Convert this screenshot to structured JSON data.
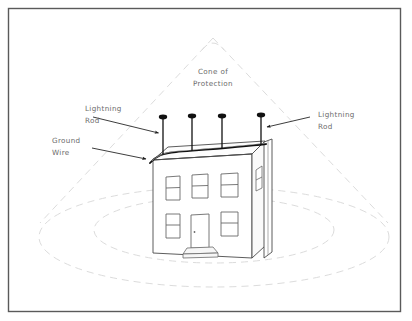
{
  "figure": {
    "background_color": "#ffffff",
    "border_color": "#555555",
    "label_color": "#6b6b6b",
    "line_color": "#3a3a3a",
    "faint_line_color": "#dcdcdc",
    "wire_color": "#1a1a1a"
  },
  "labels": {
    "cone": {
      "line1": "Cone of",
      "line2": "Protection"
    },
    "lightning_rod_left": {
      "line1": "Lightning",
      "line2": "Rod"
    },
    "lightning_rod_right": {
      "line1": "Lightning",
      "line2": "Rod"
    },
    "ground_wire": {
      "line1": "Ground",
      "line2": "Wire"
    }
  },
  "components": {
    "lightning_rods": [
      {
        "name": "rod-1",
        "x": 163,
        "tip_y": 116,
        "base_y": 156
      },
      {
        "name": "rod-2",
        "x": 192,
        "tip_y": 115,
        "base_y": 152
      },
      {
        "name": "rod-3",
        "x": 222,
        "tip_y": 115,
        "base_y": 149
      },
      {
        "name": "rod-4",
        "x": 261,
        "tip_y": 114,
        "base_y": 146
      }
    ],
    "ground_wire": {
      "name": "ground-wire",
      "runs_along": "roof ridge"
    },
    "down_conductor": {
      "name": "down-conductor",
      "x": 268,
      "top_y": 140,
      "bottom_y": 258
    },
    "building": {
      "name": "two-story-house",
      "front_windows_upper": 3,
      "front_windows_lower": 2,
      "side_windows": 2,
      "doors": 1,
      "stoop": 1
    },
    "protection_zone": {
      "apex": {
        "x": 213,
        "y": 38
      },
      "base_left": {
        "x": 40,
        "y": 222
      },
      "base_right": {
        "x": 388,
        "y": 222
      },
      "ellipses": 2
    }
  }
}
